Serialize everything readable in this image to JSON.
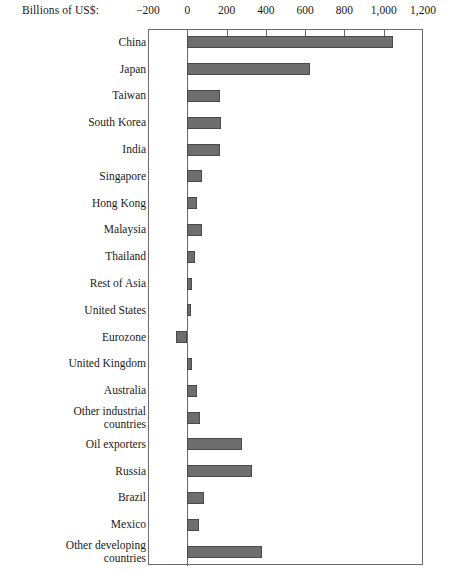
{
  "chart_data": {
    "type": "bar",
    "orientation": "horizontal",
    "title": "",
    "xlabel": "Billions of US$:",
    "ylabel": "",
    "xlim": [
      -200,
      1200
    ],
    "xticks": [
      -200,
      0,
      200,
      400,
      600,
      800,
      1000,
      1200
    ],
    "xtick_labels": [
      "−200",
      "0",
      "200",
      "400",
      "600",
      "800",
      "1,000",
      "1,200"
    ],
    "grid": false,
    "legend": null,
    "bar_color": "#6e6e6e",
    "bar_edge_color": "#4a4a4a",
    "axis_color": "#6b6b6b",
    "categories": [
      "China",
      "Japan",
      "Taiwan",
      "South Korea",
      "India",
      "Singapore",
      "Hong Kong",
      "Malaysia",
      "Thailand",
      "Rest of Asia",
      "United States",
      "Eurozone",
      "United Kingdom",
      "Australia",
      "Other industrial\ncountries",
      "Oil exporters",
      "Russia",
      "Brazil",
      "Mexico",
      "Other developing\ncountries"
    ],
    "values": [
      1046,
      623,
      168,
      172,
      168,
      77,
      50,
      73,
      41,
      25,
      20,
      -59,
      23,
      48,
      63,
      277,
      327,
      86,
      59,
      382
    ]
  }
}
